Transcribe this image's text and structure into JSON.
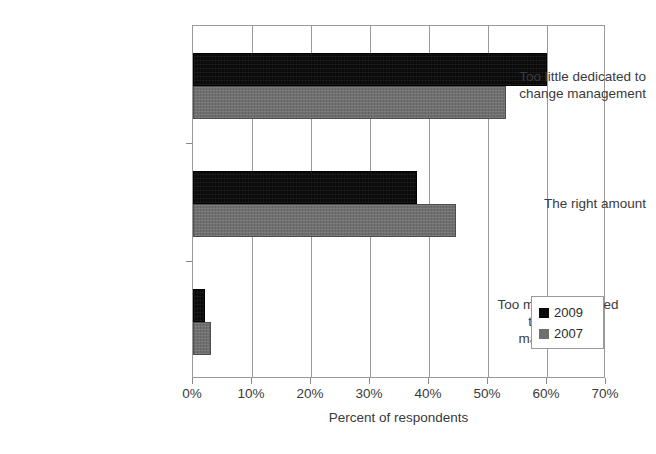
{
  "chart_data": {
    "type": "bar",
    "orientation": "horizontal",
    "title": "",
    "xlabel": "Percent of respondents",
    "ylabel": "",
    "xlim": [
      0,
      70
    ],
    "xticks": [
      "0%",
      "10%",
      "20%",
      "30%",
      "40%",
      "50%",
      "60%",
      "70%"
    ],
    "xtick_values": [
      0,
      10,
      20,
      30,
      40,
      50,
      60,
      70
    ],
    "grid": "vertical",
    "legend_position": "lower-right",
    "categories": [
      "Too little dedicated to change management",
      "The right amount",
      "Too much dedicated to change management"
    ],
    "category_label_lines": [
      [
        "Too little dedicated to",
        "change management"
      ],
      [
        "The right amount"
      ],
      [
        "Too much dedicated",
        "to change",
        "management"
      ]
    ],
    "series": [
      {
        "name": "2009",
        "color": "#0a0a0a",
        "values": [
          60,
          38,
          2
        ]
      },
      {
        "name": "2007",
        "color": "#6f6f6f",
        "values": [
          53,
          44.5,
          3
        ]
      }
    ]
  },
  "axis": {
    "x_title": "Percent of respondents",
    "tick_labels": [
      "0%",
      "10%",
      "20%",
      "30%",
      "40%",
      "50%",
      "60%",
      "70%"
    ]
  },
  "legend": {
    "entries": [
      {
        "label": "2009",
        "color": "#0a0a0a"
      },
      {
        "label": "2007",
        "color": "#6f6f6f"
      }
    ]
  },
  "colors": {
    "series_2009": "#0a0a0a",
    "series_2007": "#6f6f6f",
    "axis_line": "#9a9a9a",
    "text": "#3a3a3a",
    "background": "#ffffff"
  }
}
